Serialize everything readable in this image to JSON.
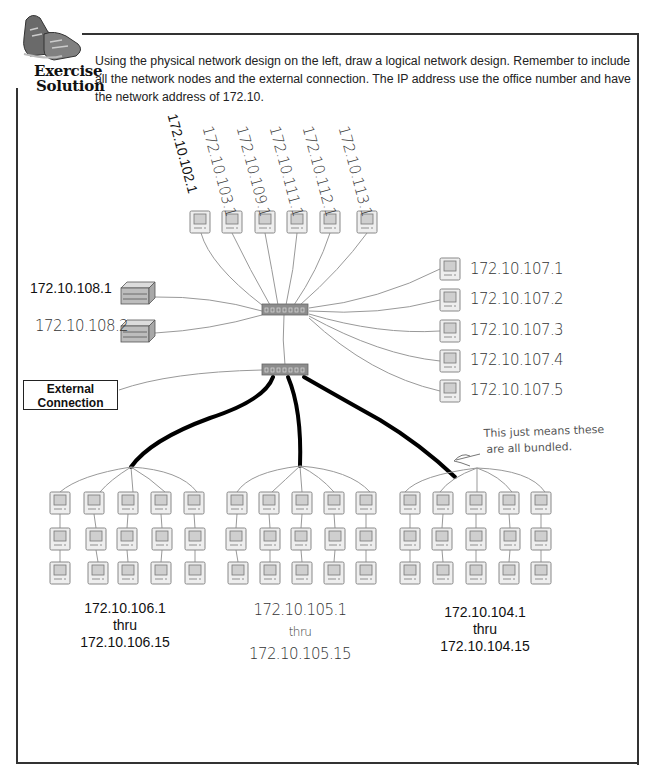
{
  "badge": {
    "line1": "Exercise",
    "line2": "Solution",
    "icon": "sneakers-icon"
  },
  "instructions": "Using the physical network design on the left, draw a logical network design. Remember to include all the network nodes and the external connection. The IP address use the office number and have the network address of 172.10.",
  "top_nodes": [
    {
      "ip": "172.10.102.1"
    },
    {
      "ip": "172.10.103.1"
    },
    {
      "ip": "172.10.109.1"
    },
    {
      "ip": "172.10.111.1"
    },
    {
      "ip": "172.10.112.1"
    },
    {
      "ip": "172.10.113.1"
    }
  ],
  "servers": [
    {
      "ip": "172.10.108.1"
    },
    {
      "ip": "172.10.108.2"
    }
  ],
  "right_nodes": [
    {
      "ip": "172.10.107.1"
    },
    {
      "ip": "172.10.107.2"
    },
    {
      "ip": "172.10.107.3"
    },
    {
      "ip": "172.10.107.4"
    },
    {
      "ip": "172.10.107.5"
    }
  ],
  "external": {
    "line1": "External",
    "line2": "Connection"
  },
  "note": {
    "line1": "This just means these",
    "line2": "are all bundled."
  },
  "groups": [
    {
      "start": "172.10.106.1",
      "thru": "thru",
      "end": "172.10.106.15",
      "count": 15
    },
    {
      "start": "172.10.105.1",
      "thru": "thru",
      "end": "172.10.105.15",
      "count": 15
    },
    {
      "start": "172.10.104.1",
      "thru": "thru",
      "end": "172.10.104.15",
      "count": 15
    }
  ],
  "colors": {
    "frame": "#333333",
    "cable": "#999999",
    "trunk": "#000000",
    "switch": "#8c8c8c",
    "computer_fill": "#eeeeee"
  }
}
